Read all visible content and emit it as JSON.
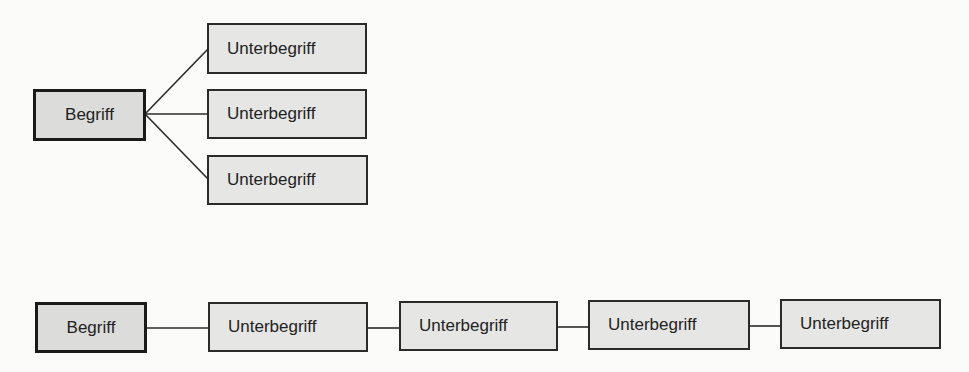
{
  "diagram": {
    "colors": {
      "background": "#fbfbfa",
      "box_fill": "#e6e6e4",
      "root_fill": "#dcdcda",
      "border": "#2a2a2a",
      "line": "#2a2a2a",
      "text": "#222222"
    },
    "tree": {
      "root": {
        "label": "Begriff"
      },
      "children": [
        {
          "label": "Unterbegriff"
        },
        {
          "label": "Unterbegriff"
        },
        {
          "label": "Unterbegriff"
        }
      ]
    },
    "chain": {
      "root": {
        "label": "Begriff"
      },
      "items": [
        {
          "label": "Unterbegriff"
        },
        {
          "label": "Unterbegriff"
        },
        {
          "label": "Unterbegriff"
        },
        {
          "label": "Unterbegriff"
        }
      ]
    }
  }
}
